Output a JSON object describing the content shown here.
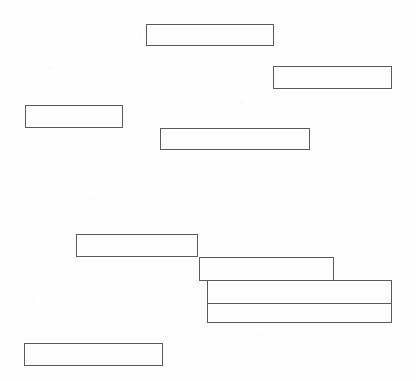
{
  "page": {
    "width": 415,
    "height": 381,
    "background_color": "#fefefe",
    "stroke_color": "#5a5a5a",
    "stroke_width": 1
  },
  "boxes": [
    {
      "id": "box-1",
      "name": "field-box-top-center",
      "label": "",
      "x": 146,
      "y": 24,
      "width": 128,
      "height": 22,
      "stroke_color": "#5a5a5a"
    },
    {
      "id": "box-2",
      "name": "field-box-top-right",
      "label": "",
      "x": 273,
      "y": 66,
      "width": 119,
      "height": 23,
      "stroke_color": "#5a5a5a"
    },
    {
      "id": "box-3",
      "name": "field-box-left-upper",
      "label": "",
      "x": 25,
      "y": 105,
      "width": 98,
      "height": 23,
      "stroke_color": "#5a5a5a"
    },
    {
      "id": "box-4",
      "name": "field-box-middle-center",
      "label": "",
      "x": 160,
      "y": 128,
      "width": 150,
      "height": 22,
      "stroke_color": "#5a5a5a"
    },
    {
      "id": "box-5",
      "name": "field-box-stack-step-one",
      "label": "",
      "x": 76,
      "y": 234,
      "width": 122,
      "height": 23,
      "stroke_color": "#5a5a5a"
    },
    {
      "id": "box-6",
      "name": "field-box-stack-step-two",
      "label": "",
      "x": 199,
      "y": 257,
      "width": 135,
      "height": 24,
      "stroke_color": "#5a5a5a"
    },
    {
      "id": "box-7",
      "name": "field-box-stack-step-three",
      "label": "",
      "x": 207,
      "y": 280,
      "width": 185,
      "height": 43,
      "stroke_color": "#5a5a5a",
      "divider_offset_y": 23
    },
    {
      "id": "box-8",
      "name": "field-box-bottom-left",
      "label": "",
      "x": 24,
      "y": 343,
      "width": 139,
      "height": 23,
      "stroke_color": "#5a5a5a"
    }
  ]
}
